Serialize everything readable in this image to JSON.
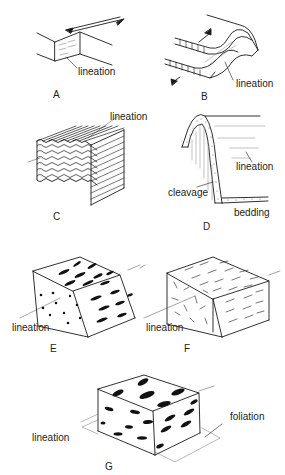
{
  "figure": {
    "panels": [
      {
        "id": "A",
        "caption": "A",
        "labels": [
          "lineation"
        ],
        "description": "Slickenside lineation on a fault plane with opposing shear arrows"
      },
      {
        "id": "B",
        "caption": "B",
        "labels": [
          "lineation"
        ],
        "description": "Lineation parallel to fold hinge in layered rock with slip arrows"
      },
      {
        "id": "C",
        "caption": "C",
        "labels": [
          "lineation"
        ],
        "description": "Crenulation lineation on a corrugated block"
      },
      {
        "id": "D",
        "caption": "D",
        "labels": [
          "lineation",
          "cleavage",
          "bedding"
        ],
        "description": "Intersection lineation of cleavage and bedding in a fold"
      },
      {
        "id": "E",
        "caption": "E",
        "labels": [
          "lineation"
        ],
        "description": "Block with elongate grains defining mineral lineation"
      },
      {
        "id": "F",
        "caption": "F",
        "labels": [
          "lineation"
        ],
        "description": "Block with aligned needle-like minerals"
      },
      {
        "id": "G",
        "caption": "G",
        "labels": [
          "lineation",
          "foliation"
        ],
        "description": "Block with flattened elongate grains defining foliation and lineation"
      }
    ]
  },
  "colors": {
    "ink": "#1a1a1a",
    "guide": "#9a9a9a",
    "stipple": "#555555"
  }
}
